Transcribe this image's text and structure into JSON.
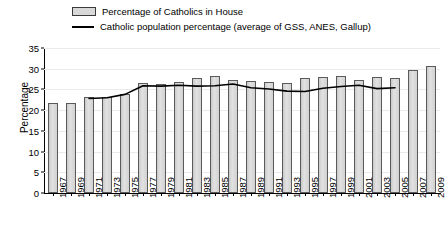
{
  "legend": {
    "items": [
      {
        "label": "Percentage of Catholics in House",
        "type": "bar-swatch"
      },
      {
        "label": "Catholic population percentage (average of GSS, ANES, Gallup)",
        "type": "line-swatch"
      }
    ]
  },
  "axes": {
    "ylabel": "Percentage",
    "yticks": [
      "0",
      "5",
      "10",
      "15",
      "20",
      "25",
      "30",
      "35"
    ]
  },
  "colors": {
    "bar_fill": "#d9d9d9",
    "bar_border": "#5a5a5a",
    "line": "#000000",
    "gridline": "#ebebeb",
    "axis": "#000000"
  },
  "chart_data": {
    "type": "bar",
    "title": "",
    "xlabel": "",
    "ylabel": "Percentage",
    "ylim": [
      0,
      35
    ],
    "ytick_step": 5,
    "grid": true,
    "legend_position": "top",
    "categories": [
      "1967",
      "1969",
      "1971",
      "1973",
      "1975",
      "1977",
      "1979",
      "1981",
      "1983",
      "1985",
      "1987",
      "1989",
      "1991",
      "1993",
      "1995",
      "1997",
      "1999",
      "2001",
      "2003",
      "2005",
      "2007",
      "2009"
    ],
    "series": [
      {
        "name": "Percentage of Catholics in House",
        "type": "bar",
        "values": [
          21.8,
          21.8,
          23.2,
          23.2,
          24.0,
          26.6,
          26.4,
          26.9,
          27.8,
          28.3,
          27.4,
          27.1,
          26.8,
          26.5,
          27.8,
          28.1,
          28.3,
          27.4,
          28.1,
          27.8,
          29.8,
          30.6
        ]
      },
      {
        "name": "Catholic population percentage (average of GSS, ANES, Gallup)",
        "type": "line",
        "x": [
          "1971",
          "1973",
          "1975",
          "1977",
          "1979",
          "1981",
          "1983",
          "1985",
          "1987",
          "1989",
          "1991",
          "1993",
          "1995",
          "1997",
          "1999",
          "2001",
          "2003",
          "2005"
        ],
        "values": [
          22.8,
          23.0,
          23.8,
          25.9,
          25.8,
          26.0,
          25.8,
          25.9,
          26.3,
          25.4,
          25.1,
          24.6,
          24.5,
          25.3,
          25.7,
          26.0,
          25.2,
          25.4
        ]
      }
    ]
  }
}
